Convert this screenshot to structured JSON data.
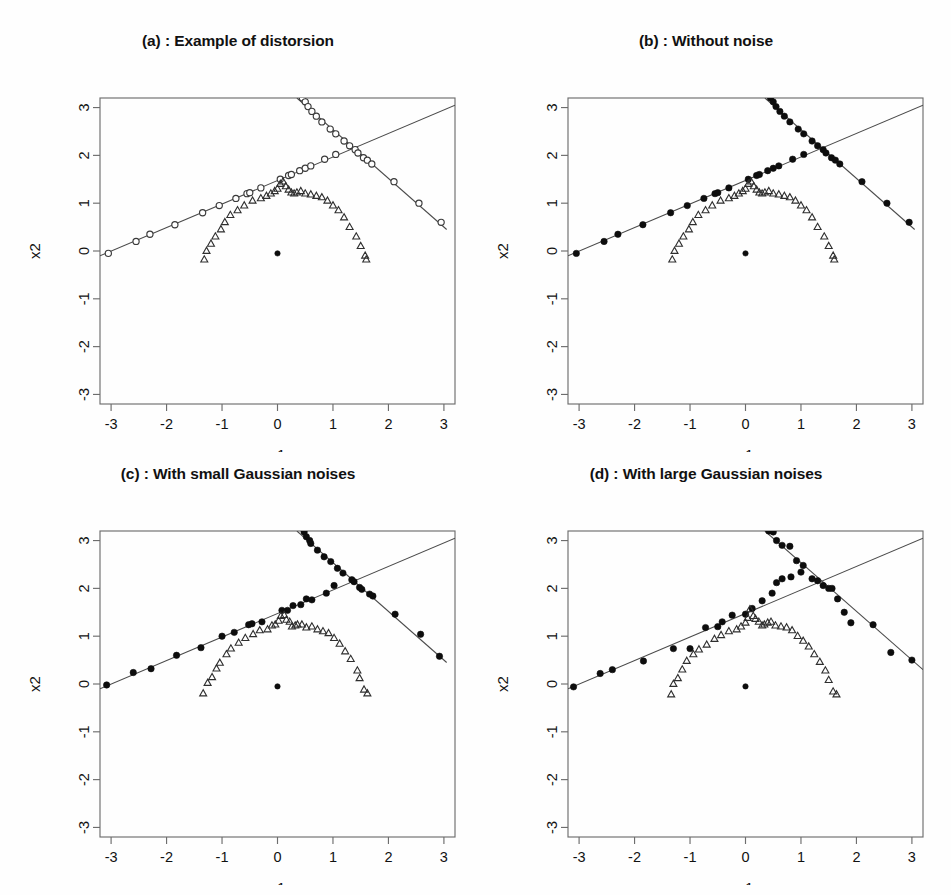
{
  "figure": {
    "axis_x_label": "x1",
    "axis_y_label": "x2",
    "tick_labels_x": [
      "-3",
      "-2",
      "-1",
      "0",
      "1",
      "2",
      "3"
    ],
    "tick_labels_y": [
      "-3",
      "-2",
      "-1",
      "0",
      "1",
      "2",
      "3"
    ],
    "colors": {
      "frame": "#6d6d6d",
      "line": "#4a4a4a",
      "point_filled": "#0d0d0d",
      "point_open_stroke": "#3a3a3a",
      "triangle_stroke": "#2e2e2e",
      "text": "#111111",
      "background": "#fefefe"
    }
  },
  "chart_data": [
    {
      "type": "scatter",
      "panel": "a",
      "title": "(a) : Example of distorsion",
      "xlabel": "x1",
      "ylabel": "x2",
      "xlim": [
        -3.2,
        3.2
      ],
      "ylim": [
        -3.2,
        3.2
      ],
      "xticks": [
        -3,
        -2,
        -1,
        0,
        1,
        2,
        3
      ],
      "yticks": [
        -3,
        -2,
        -1,
        0,
        1,
        2,
        3
      ],
      "grid": false,
      "legend": "none",
      "lines": [
        {
          "name": "ascending-line",
          "x": [
            -3.2,
            3.2
          ],
          "y": [
            -0.1,
            3.05
          ]
        },
        {
          "name": "descending-line",
          "x": [
            0.35,
            3.05
          ],
          "y": [
            3.2,
            0.45
          ]
        }
      ],
      "series": [
        {
          "name": "branch-1-open-circles",
          "marker": "open-circle",
          "x": [
            -3.05,
            -2.55,
            -2.3,
            -1.85,
            -1.35,
            -1.05,
            -0.75,
            -0.55,
            -0.5,
            -0.3,
            0.05,
            0.2,
            0.25,
            0.4,
            0.5,
            0.6,
            0.85,
            1.05
          ],
          "y": [
            -0.05,
            0.2,
            0.35,
            0.55,
            0.8,
            0.95,
            1.1,
            1.2,
            1.22,
            1.32,
            1.5,
            1.58,
            1.6,
            1.68,
            1.73,
            1.78,
            1.92,
            2.02
          ]
        },
        {
          "name": "branch-2-open-circles",
          "marker": "open-circle",
          "x": [
            0.45,
            0.5,
            0.55,
            0.62,
            0.7,
            0.8,
            0.95,
            1.05,
            1.2,
            1.3,
            1.4,
            1.45,
            1.55,
            1.62,
            1.7,
            2.1,
            2.55,
            2.95
          ],
          "y": [
            3.2,
            3.12,
            3.02,
            2.92,
            2.82,
            2.7,
            2.55,
            2.45,
            2.3,
            2.2,
            2.12,
            2.05,
            1.95,
            1.9,
            1.82,
            1.45,
            1.0,
            0.6
          ]
        },
        {
          "name": "arc-triangles",
          "marker": "open-triangle",
          "x": [
            -1.32,
            -1.28,
            -1.2,
            -1.12,
            -1.02,
            -0.95,
            -0.85,
            -0.72,
            -0.6,
            -0.45,
            -0.3,
            -0.2,
            -0.12,
            -0.05,
            0.0,
            0.05,
            0.1,
            0.15,
            0.2,
            0.25,
            0.3,
            0.35,
            0.42,
            0.5,
            0.6,
            0.7,
            0.8,
            0.9,
            1.0,
            1.1,
            1.2,
            1.3,
            1.42,
            1.5,
            1.58,
            1.6
          ],
          "y": [
            -0.18,
            0.0,
            0.15,
            0.3,
            0.45,
            0.6,
            0.75,
            0.85,
            0.95,
            1.05,
            1.1,
            1.15,
            1.2,
            1.25,
            1.3,
            1.4,
            1.45,
            1.35,
            1.28,
            1.22,
            1.2,
            1.22,
            1.25,
            1.2,
            1.18,
            1.15,
            1.12,
            1.05,
            0.95,
            0.85,
            0.7,
            0.5,
            0.3,
            0.1,
            -0.1,
            -0.18
          ]
        },
        {
          "name": "origin-point",
          "marker": "filled-circle",
          "x": [
            0.0
          ],
          "y": [
            -0.05
          ]
        }
      ]
    },
    {
      "type": "scatter",
      "panel": "b",
      "title": "(b) : Without noise",
      "xlabel": "x1",
      "ylabel": "x2",
      "xlim": [
        -3.2,
        3.2
      ],
      "ylim": [
        -3.2,
        3.2
      ],
      "xticks": [
        -3,
        -2,
        -1,
        0,
        1,
        2,
        3
      ],
      "yticks": [
        -3,
        -2,
        -1,
        0,
        1,
        2,
        3
      ],
      "grid": false,
      "legend": "none",
      "lines": [
        {
          "name": "ascending-line",
          "x": [
            -3.2,
            3.2
          ],
          "y": [
            -0.1,
            3.05
          ]
        },
        {
          "name": "descending-line",
          "x": [
            0.35,
            3.05
          ],
          "y": [
            3.2,
            0.45
          ]
        }
      ],
      "series": [
        {
          "name": "branch-1-filled-circles",
          "marker": "filled-circle",
          "x": [
            -3.05,
            -2.55,
            -2.3,
            -1.85,
            -1.35,
            -1.05,
            -0.75,
            -0.55,
            -0.5,
            -0.3,
            0.05,
            0.2,
            0.25,
            0.4,
            0.5,
            0.6,
            0.85,
            1.05
          ],
          "y": [
            -0.05,
            0.2,
            0.35,
            0.55,
            0.8,
            0.95,
            1.1,
            1.2,
            1.22,
            1.32,
            1.5,
            1.58,
            1.6,
            1.68,
            1.73,
            1.78,
            1.92,
            2.02
          ]
        },
        {
          "name": "branch-2-filled-circles",
          "marker": "filled-circle",
          "x": [
            0.45,
            0.5,
            0.55,
            0.62,
            0.7,
            0.8,
            0.95,
            1.05,
            1.2,
            1.3,
            1.4,
            1.45,
            1.55,
            1.62,
            1.7,
            2.1,
            2.55,
            2.95
          ],
          "y": [
            3.2,
            3.12,
            3.02,
            2.92,
            2.82,
            2.7,
            2.55,
            2.45,
            2.3,
            2.2,
            2.12,
            2.05,
            1.95,
            1.9,
            1.82,
            1.45,
            1.0,
            0.6
          ]
        },
        {
          "name": "arc-triangles",
          "marker": "open-triangle",
          "x": [
            -1.32,
            -1.28,
            -1.2,
            -1.12,
            -1.02,
            -0.95,
            -0.85,
            -0.72,
            -0.6,
            -0.45,
            -0.3,
            -0.2,
            -0.12,
            -0.05,
            0.0,
            0.05,
            0.1,
            0.15,
            0.2,
            0.25,
            0.3,
            0.35,
            0.42,
            0.5,
            0.6,
            0.7,
            0.8,
            0.9,
            1.0,
            1.1,
            1.2,
            1.3,
            1.42,
            1.5,
            1.58,
            1.6
          ],
          "y": [
            -0.18,
            0.0,
            0.15,
            0.3,
            0.45,
            0.6,
            0.75,
            0.85,
            0.95,
            1.05,
            1.1,
            1.15,
            1.2,
            1.25,
            1.3,
            1.4,
            1.45,
            1.35,
            1.28,
            1.22,
            1.2,
            1.22,
            1.25,
            1.2,
            1.18,
            1.15,
            1.12,
            1.05,
            0.95,
            0.85,
            0.7,
            0.5,
            0.3,
            0.1,
            -0.1,
            -0.18
          ]
        },
        {
          "name": "origin-point",
          "marker": "filled-circle",
          "x": [
            0.0
          ],
          "y": [
            -0.05
          ]
        }
      ]
    },
    {
      "type": "scatter",
      "panel": "c",
      "title": "(c) : With small Gaussian noises",
      "xlabel": "x1",
      "ylabel": "x2",
      "xlim": [
        -3.2,
        3.2
      ],
      "ylim": [
        -3.2,
        3.2
      ],
      "xticks": [
        -3,
        -2,
        -1,
        0,
        1,
        2,
        3
      ],
      "yticks": [
        -3,
        -2,
        -1,
        0,
        1,
        2,
        3
      ],
      "grid": false,
      "legend": "none",
      "noise_sd": "small",
      "lines": [
        {
          "name": "ascending-line",
          "x": [
            -3.2,
            3.2
          ],
          "y": [
            -0.1,
            3.05
          ]
        },
        {
          "name": "descending-line",
          "x": [
            0.35,
            3.05
          ],
          "y": [
            3.2,
            0.45
          ]
        }
      ],
      "series": [
        {
          "name": "branch-1-filled-circles",
          "marker": "filled-circle",
          "x": [
            -3.08,
            -2.6,
            -2.28,
            -1.82,
            -1.38,
            -1.0,
            -0.78,
            -0.52,
            -0.46,
            -0.28,
            0.08,
            0.18,
            0.28,
            0.42,
            0.52,
            0.62,
            0.88,
            1.02
          ],
          "y": [
            -0.02,
            0.24,
            0.32,
            0.6,
            0.76,
            1.0,
            1.08,
            1.24,
            1.26,
            1.3,
            1.54,
            1.54,
            1.64,
            1.66,
            1.78,
            1.76,
            1.9,
            2.06
          ]
        },
        {
          "name": "branch-2-filled-circles",
          "marker": "filled-circle",
          "x": [
            0.48,
            0.52,
            0.58,
            0.6,
            0.72,
            0.84,
            0.96,
            1.08,
            1.18,
            1.34,
            1.38,
            1.48,
            1.52,
            1.66,
            1.72,
            2.12,
            2.58,
            2.92
          ],
          "y": [
            3.18,
            3.08,
            3.0,
            2.94,
            2.8,
            2.66,
            2.56,
            2.42,
            2.32,
            2.18,
            2.14,
            2.02,
            1.98,
            1.88,
            1.84,
            1.46,
            1.04,
            0.58
          ]
        },
        {
          "name": "arc-triangles",
          "marker": "open-triangle",
          "x": [
            -1.34,
            -1.26,
            -1.18,
            -1.1,
            -1.04,
            -0.92,
            -0.84,
            -0.7,
            -0.58,
            -0.44,
            -0.32,
            -0.18,
            -0.1,
            -0.04,
            0.02,
            0.06,
            0.12,
            0.16,
            0.22,
            0.26,
            0.32,
            0.36,
            0.44,
            0.52,
            0.62,
            0.72,
            0.82,
            0.92,
            1.02,
            1.12,
            1.22,
            1.32,
            1.44,
            1.48,
            1.56,
            1.62
          ],
          "y": [
            -0.2,
            0.02,
            0.14,
            0.32,
            0.44,
            0.62,
            0.74,
            0.86,
            0.96,
            1.04,
            1.12,
            1.14,
            1.22,
            1.24,
            1.32,
            1.42,
            1.44,
            1.34,
            1.3,
            1.2,
            1.22,
            1.24,
            1.24,
            1.18,
            1.2,
            1.14,
            1.1,
            1.06,
            0.96,
            0.84,
            0.68,
            0.52,
            0.28,
            0.12,
            -0.12,
            -0.2
          ]
        },
        {
          "name": "origin-point",
          "marker": "filled-circle",
          "x": [
            0.0
          ],
          "y": [
            -0.05
          ]
        }
      ]
    },
    {
      "type": "scatter",
      "panel": "d",
      "title": "(d) : With large Gaussian noises",
      "xlabel": "x1",
      "ylabel": "x2",
      "xlim": [
        -3.2,
        3.2
      ],
      "ylim": [
        -3.2,
        3.2
      ],
      "xticks": [
        -3,
        -2,
        -1,
        0,
        1,
        2,
        3
      ],
      "yticks": [
        -3,
        -2,
        -1,
        0,
        1,
        2,
        3
      ],
      "grid": false,
      "legend": "none",
      "noise_sd": "large",
      "lines": [
        {
          "name": "ascending-line",
          "x": [
            -3.2,
            3.2
          ],
          "y": [
            -0.1,
            3.05
          ]
        },
        {
          "name": "descending-line",
          "x": [
            0.35,
            3.2
          ],
          "y": [
            3.2,
            0.3
          ]
        }
      ],
      "series": [
        {
          "name": "branch-1-filled-circles",
          "marker": "filled-circle",
          "x": [
            -3.1,
            -2.62,
            -2.4,
            -1.84,
            -1.3,
            -1.0,
            -0.72,
            -0.5,
            -0.42,
            -0.24,
            0.0,
            0.12,
            0.3,
            0.48,
            0.56,
            0.66,
            0.82,
            1.0
          ],
          "y": [
            -0.06,
            0.22,
            0.3,
            0.48,
            0.74,
            0.74,
            1.18,
            1.2,
            1.3,
            1.44,
            1.46,
            1.58,
            1.74,
            1.9,
            2.12,
            2.2,
            2.24,
            2.34
          ]
        },
        {
          "name": "branch-2-filled-circles",
          "marker": "filled-circle",
          "x": [
            0.42,
            0.5,
            0.56,
            0.66,
            0.8,
            0.92,
            1.04,
            1.2,
            1.3,
            1.4,
            1.5,
            1.56,
            1.66,
            1.78,
            1.9,
            2.3,
            2.62,
            3.0
          ],
          "y": [
            3.2,
            3.18,
            3.0,
            2.9,
            2.88,
            2.58,
            2.48,
            2.2,
            2.16,
            2.06,
            2.0,
            2.0,
            1.78,
            1.5,
            1.28,
            1.24,
            0.66,
            0.5
          ]
        },
        {
          "name": "arc-triangles",
          "marker": "open-triangle",
          "x": [
            -1.34,
            -1.3,
            -1.22,
            -1.14,
            -1.06,
            -0.94,
            -0.84,
            -0.7,
            -0.56,
            -0.44,
            -0.3,
            -0.16,
            -0.08,
            0.0,
            0.04,
            0.08,
            0.14,
            0.18,
            0.24,
            0.3,
            0.34,
            0.4,
            0.46,
            0.54,
            0.64,
            0.74,
            0.84,
            0.94,
            1.04,
            1.14,
            1.24,
            1.34,
            1.44,
            1.5,
            1.58,
            1.64
          ],
          "y": [
            -0.22,
            0.0,
            0.12,
            0.3,
            0.48,
            0.62,
            0.72,
            0.82,
            0.94,
            1.02,
            1.1,
            1.14,
            1.2,
            1.28,
            1.38,
            1.56,
            1.42,
            1.36,
            1.3,
            1.22,
            1.24,
            1.28,
            1.3,
            1.22,
            1.2,
            1.18,
            1.12,
            1.0,
            0.9,
            0.78,
            0.62,
            0.46,
            0.28,
            0.08,
            -0.16,
            -0.22
          ]
        },
        {
          "name": "origin-point",
          "marker": "filled-circle",
          "x": [
            0.0
          ],
          "y": [
            -0.05
          ]
        }
      ]
    }
  ]
}
